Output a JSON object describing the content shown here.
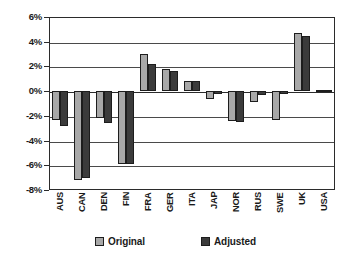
{
  "chart_data": {
    "type": "bar",
    "title": "",
    "subtitle": "",
    "xlabel": "",
    "ylabel": "",
    "ylim": [
      -8,
      6
    ],
    "ytick_values": [
      6,
      4,
      2,
      0,
      -2,
      -4,
      -6,
      -8
    ],
    "ytick_labels": [
      "6%",
      "4%",
      "2%",
      "0%",
      "-2%",
      "-4%",
      "-6%",
      "-8%"
    ],
    "grid": true,
    "legend_position": "bottom",
    "categories": [
      "AUS",
      "CAN",
      "DEN",
      "FIN",
      "FRA",
      "GER",
      "ITA",
      "JAP",
      "NOR",
      "RUS",
      "SWE",
      "UK",
      "USA"
    ],
    "series": [
      {
        "name": "Original",
        "color": "#a8a8a8",
        "values": [
          -2.3,
          -7.2,
          -2.2,
          -5.9,
          3.0,
          1.8,
          0.8,
          -0.6,
          -2.4,
          -0.9,
          -2.3,
          4.7,
          0.1
        ]
      },
      {
        "name": "Adjusted",
        "color": "#3b3b3b",
        "values": [
          -2.8,
          -7.0,
          -2.6,
          -5.9,
          2.2,
          1.6,
          0.8,
          -0.2,
          -2.5,
          -0.3,
          -0.2,
          4.5,
          0.1
        ]
      }
    ]
  },
  "legend": {
    "items": [
      {
        "label": "Original",
        "swatch": "original"
      },
      {
        "label": "Adjusted",
        "swatch": "adjusted"
      }
    ]
  }
}
